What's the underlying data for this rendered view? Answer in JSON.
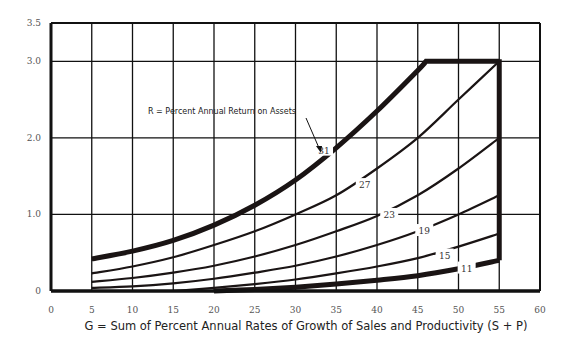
{
  "chart_data": {
    "type": "line",
    "title": "",
    "xlabel": "G = Sum of Percent Annual Rates of Growth of Sales and Productivity (S + P)",
    "ylabel": "",
    "xlim": [
      0,
      60
    ],
    "ylim": [
      0,
      3.5
    ],
    "x_ticks": [
      0,
      5,
      10,
      15,
      20,
      25,
      30,
      35,
      40,
      45,
      50,
      55,
      60
    ],
    "y_ticks": [
      0,
      1.0,
      2.0,
      3.0,
      3.5
    ],
    "y_tick_labels": [
      "0",
      "1.0",
      "2.0",
      "3.0",
      "3.5"
    ],
    "grid": true,
    "legend": "none",
    "annotation": {
      "text": "R = Percent Annual Return on Assets",
      "arrow_to_series": "31"
    },
    "series": [
      {
        "name": "31",
        "label": "31",
        "thick": true,
        "x": [
          5,
          10,
          15,
          20,
          25,
          30,
          35,
          40,
          45,
          46,
          55
        ],
        "y": [
          0.42,
          0.52,
          0.66,
          0.86,
          1.12,
          1.45,
          1.87,
          2.35,
          2.88,
          3.0,
          3.0
        ]
      },
      {
        "name": "27",
        "label": "27",
        "thick": false,
        "x": [
          5,
          10,
          15,
          20,
          25,
          30,
          35,
          40,
          45,
          50,
          55
        ],
        "y": [
          0.23,
          0.32,
          0.44,
          0.6,
          0.78,
          1.0,
          1.25,
          1.6,
          2.0,
          2.5,
          3.0
        ]
      },
      {
        "name": "23",
        "label": "23",
        "thick": false,
        "x": [
          5,
          10,
          15,
          20,
          25,
          30,
          35,
          40,
          45,
          50,
          55
        ],
        "y": [
          0.12,
          0.17,
          0.24,
          0.33,
          0.45,
          0.6,
          0.78,
          0.98,
          1.25,
          1.6,
          2.0
        ]
      },
      {
        "name": "19",
        "label": "19",
        "thick": false,
        "x": [
          5,
          10,
          15,
          20,
          25,
          30,
          35,
          40,
          45,
          50,
          55
        ],
        "y": [
          0.04,
          0.06,
          0.1,
          0.16,
          0.24,
          0.33,
          0.45,
          0.6,
          0.78,
          1.0,
          1.25
        ]
      },
      {
        "name": "15",
        "label": "15",
        "thick": false,
        "x": [
          15,
          20,
          25,
          30,
          35,
          40,
          45,
          50,
          55
        ],
        "y": [
          0.0,
          0.04,
          0.09,
          0.15,
          0.23,
          0.32,
          0.43,
          0.58,
          0.75
        ]
      },
      {
        "name": "11",
        "label": "11",
        "thick": true,
        "x": [
          20,
          25,
          30,
          35,
          40,
          45,
          50,
          55
        ],
        "y": [
          0.0,
          0.02,
          0.05,
          0.09,
          0.14,
          0.2,
          0.29,
          0.4
        ]
      }
    ],
    "boundary": {
      "x": 55,
      "y_from": 0.4,
      "y_to": 3.0
    }
  }
}
